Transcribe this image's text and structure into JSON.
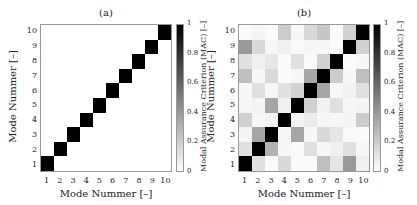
{
  "chart_data": [
    {
      "type": "heatmap",
      "title": "(a)",
      "xlabel": "Mode Nummer [–]",
      "ylabel": "Mode Nummer [–]",
      "x_ticks": [
        "1",
        "2",
        "3",
        "4",
        "5",
        "6",
        "7",
        "8",
        "9",
        "10"
      ],
      "y_ticks": [
        "1",
        "2",
        "3",
        "4",
        "5",
        "6",
        "7",
        "8",
        "9",
        "10"
      ],
      "colorbar": {
        "label": "Modal Assurance Criterion (MAC) [–]",
        "ticks": [
          "0",
          "0.2",
          "0.4",
          "0.6",
          "0.8",
          "1"
        ],
        "range": [
          0,
          1
        ],
        "colormap": "gray_r"
      },
      "matrix_rows_top_to_bottom_y10_to_y1": [
        [
          0,
          0,
          0,
          0,
          0,
          0,
          0,
          0,
          0,
          1
        ],
        [
          0,
          0,
          0,
          0,
          0,
          0,
          0,
          0,
          1,
          0
        ],
        [
          0,
          0,
          0,
          0,
          0,
          0,
          0,
          1,
          0,
          0
        ],
        [
          0,
          0,
          0,
          0,
          0,
          0,
          1,
          0,
          0,
          0
        ],
        [
          0,
          0,
          0,
          0,
          0,
          1,
          0,
          0,
          0,
          0
        ],
        [
          0,
          0,
          0,
          0,
          1,
          0,
          0,
          0,
          0,
          0
        ],
        [
          0,
          0,
          0,
          1,
          0,
          0,
          0,
          0,
          0,
          0
        ],
        [
          0,
          0,
          1,
          0,
          0,
          0,
          0,
          0,
          0,
          0
        ],
        [
          0,
          1,
          0,
          0,
          0,
          0,
          0,
          0,
          0,
          0
        ],
        [
          1,
          0,
          0,
          0,
          0,
          0,
          0,
          0,
          0,
          0
        ]
      ]
    },
    {
      "type": "heatmap",
      "title": "(b)",
      "xlabel": "Mode Nummer [–]",
      "ylabel": "Mode Nummer [–]",
      "x_ticks": [
        "1",
        "2",
        "3",
        "4",
        "5",
        "6",
        "7",
        "8",
        "9",
        "10"
      ],
      "y_ticks": [
        "1",
        "2",
        "3",
        "4",
        "5",
        "6",
        "7",
        "8",
        "9",
        "10"
      ],
      "colorbar": {
        "label": "Modal Assurance Criterion (MAC) [–]",
        "ticks": [
          "0",
          "0.2",
          "0.4",
          "0.6",
          "0.8",
          "1"
        ],
        "range": [
          0,
          1
        ],
        "colormap": "gray_r"
      },
      "matrix_rows_top_to_bottom_y10_to_y1": [
        [
          0.02,
          0.04,
          0.02,
          0.2,
          0.03,
          0.15,
          0.22,
          0.02,
          0.18,
          1
        ],
        [
          0.4,
          0.15,
          0.03,
          0.06,
          0.02,
          0.03,
          0.03,
          0.02,
          1,
          0.18
        ],
        [
          0.12,
          0.06,
          0.1,
          0.02,
          0.12,
          0.02,
          0.18,
          1,
          0.02,
          0.03
        ],
        [
          0.25,
          0.03,
          0.15,
          0.02,
          0.03,
          0.35,
          1,
          0.2,
          0.03,
          0.25
        ],
        [
          0.03,
          0.12,
          0.03,
          0.12,
          0.18,
          1,
          0.35,
          0.03,
          0.05,
          0.12
        ],
        [
          0.03,
          0.04,
          0.35,
          0.06,
          1,
          0.18,
          0.05,
          0.12,
          0.03,
          0.04
        ],
        [
          0.18,
          0.03,
          0.05,
          1,
          0.05,
          0.08,
          0.03,
          0.03,
          0.04,
          0.2
        ],
        [
          0.04,
          0.35,
          1,
          0.03,
          0.35,
          0.03,
          0.15,
          0.1,
          0.02,
          0.02
        ],
        [
          0.12,
          1,
          0.3,
          0.03,
          0.02,
          0.12,
          0.03,
          0.06,
          0.12,
          0.03
        ],
        [
          1,
          0.12,
          0.02,
          0.15,
          0.02,
          0.02,
          0.25,
          0.1,
          0.4,
          0.06
        ]
      ]
    }
  ]
}
